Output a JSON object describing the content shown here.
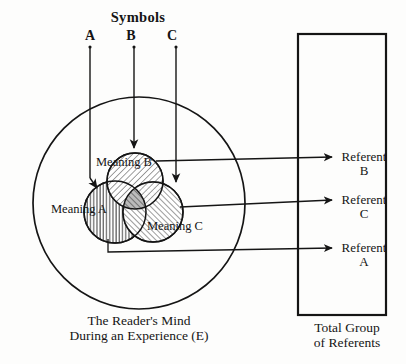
{
  "figure": {
    "type": "venn-reference-diagram",
    "title": "Symbols",
    "symbols": [
      {
        "id": "A",
        "label": "A",
        "x": 90,
        "y": 28
      },
      {
        "id": "B",
        "label": "B",
        "x": 131,
        "y": 28
      },
      {
        "id": "C",
        "label": "C",
        "x": 172,
        "y": 28
      }
    ],
    "meanings": [
      {
        "id": "A",
        "label": "Meaning A",
        "hatch": "vertical",
        "cx": 115,
        "cy": 212,
        "r": 31
      },
      {
        "id": "B",
        "label": "Meaning B",
        "hatch": "diagonal-down",
        "cx": 135,
        "cy": 181,
        "r": 28
      },
      {
        "id": "C",
        "label": "Meaning C",
        "hatch": "diagonal-up",
        "cx": 153,
        "cy": 212,
        "r": 30
      }
    ],
    "mind_circle": {
      "cx": 139,
      "cy": 203,
      "r": 106
    },
    "mind_caption_line1": "The Reader's Mind",
    "mind_caption_line2": "During an Experience (E)",
    "referent_box": {
      "x": 298,
      "y": 34,
      "width": 88,
      "height": 281
    },
    "referents": [
      {
        "id": "B",
        "line1": "Referent",
        "line2": "B",
        "y": 157
      },
      {
        "id": "C",
        "line1": "Referent",
        "line2": "C",
        "y": 200
      },
      {
        "id": "A",
        "line1": "Referent",
        "line2": "A",
        "y": 248
      }
    ],
    "referents_caption_line1": "Total Group",
    "referents_caption_line2": "of Referents",
    "colors": {
      "ink": "#151515",
      "paper": "#fdfdfc",
      "hatch": "#1b1b1b"
    }
  }
}
